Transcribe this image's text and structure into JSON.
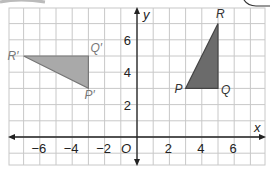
{
  "chart_data": {
    "type": "coordinate-grid",
    "title": "",
    "xlabel": "x",
    "ylabel": "y",
    "origin_label": "O",
    "xlim": [
      -8,
      8
    ],
    "ylim": [
      -2,
      8
    ],
    "grid": true,
    "x_tick_labels": [
      "−6",
      "−4",
      "−2",
      "2",
      "4",
      "6"
    ],
    "x_tick_values": [
      -6,
      -4,
      -2,
      2,
      4,
      6
    ],
    "y_tick_labels": [
      "2",
      "4",
      "6"
    ],
    "y_tick_values": [
      2,
      4,
      6
    ],
    "shapes": [
      {
        "name": "Triangle PQR",
        "fill": "#6b6b6b",
        "vertices": [
          {
            "label": "P",
            "x": 3,
            "y": 3
          },
          {
            "label": "Q",
            "x": 5,
            "y": 3
          },
          {
            "label": "R",
            "x": 5,
            "y": 7
          }
        ]
      },
      {
        "name": "Triangle P'Q'R'",
        "fill": "#a9a9a9",
        "vertices": [
          {
            "label": "P′",
            "x": -3,
            "y": 3
          },
          {
            "label": "Q′",
            "x": -3,
            "y": 5
          },
          {
            "label": "R′",
            "x": -7,
            "y": 5
          }
        ]
      }
    ]
  },
  "colors": {
    "grid": "#c8c8c8",
    "axis": "#222222",
    "original_fill": "#6b6b6b",
    "image_fill": "#a9a9a9"
  }
}
